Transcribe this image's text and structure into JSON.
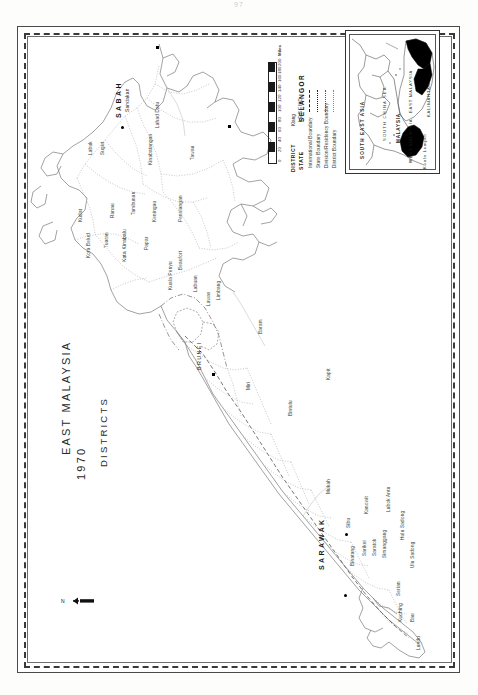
{
  "document": {
    "page_number": "97"
  },
  "map": {
    "title_line1": "EAST MALAYSIA",
    "title_line2": "1970",
    "title_line3": "DISTRICTS",
    "north_arrow": "north-arrow",
    "states": [
      {
        "name": "SABAH"
      },
      {
        "name": "SARAWAK"
      },
      {
        "name": "BRUNEI"
      }
    ],
    "districts": [
      "Kudat",
      "Kota Belud",
      "Ranau",
      "Labuk",
      "Sugut",
      "Tuaran",
      "Kota Kinabalu",
      "Papar",
      "Tambunan",
      "Keningau",
      "Kinabatangan",
      "Sandakan",
      "Lahad Datu",
      "Tawau",
      "Pensiangan",
      "Kuala Penyu",
      "Beaufort",
      "Labuan",
      "Lawas",
      "Limbang",
      "Baram",
      "Miri",
      "Bintulu",
      "Kapit",
      "Mukah",
      "Sibu",
      "Binatang",
      "Sarikei",
      "Kanowit",
      "Saratok",
      "Simanggang",
      "Lubok Antu",
      "Serian",
      "Kuching",
      "Bau",
      "Lundu",
      "Ulu Sadong",
      "Hulu Sadong"
    ],
    "cities": [
      "Kota Kinabalu",
      "Sandakan",
      "Tawau",
      "Miri",
      "Sibu",
      "Kuching"
    ]
  },
  "scale": {
    "unit_label": "Miles",
    "ticks": [
      "0",
      "20",
      "40",
      "60",
      "80",
      "100",
      "120",
      "140",
      "160",
      "180",
      "200"
    ]
  },
  "legend": {
    "heading": "LEGEND",
    "items": [
      {
        "label": "International Boundary",
        "style": "dash-long"
      },
      {
        "label": "State Boundary",
        "style": "dash-dot"
      },
      {
        "label": "Division/Residency Boundary",
        "style": "dotted"
      },
      {
        "label": "District Boundary",
        "style": "fine-dot"
      }
    ],
    "example_heads": [
      "STATE",
      "DISTRICT"
    ],
    "example_state": "SELANGOR",
    "example_district": "Klang"
  },
  "inset": {
    "title": "SOUTH EAST ASIA",
    "labels": [
      "SOUTH CHINA SEA",
      "MALAYSIA",
      "EAST MALAYSIA",
      "WEST MALAYSIA",
      "KALIMANTAN",
      "Kuala Lumpur"
    ]
  },
  "colors": {
    "ink": "#1a1a1a",
    "paper": "#ffffff",
    "fill_dark": "#000000",
    "line_light": "#9a9a9a"
  }
}
